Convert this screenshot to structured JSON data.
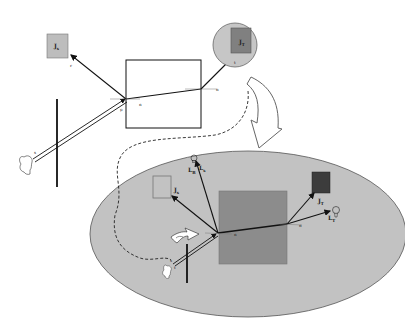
{
  "colors": {
    "background": "#ffffff",
    "ellipse_fill": "#c2c2c2",
    "circle_fill": "#c6c6c6",
    "light_square": "#bdbdbd",
    "mid_square": "#808080",
    "dark_square": "#3c3c3c",
    "big_square": "#8c8c8c",
    "stroke": "#111111"
  },
  "top_scene": {
    "reflect_source_label": "J",
    "reflect_source_sub": "s",
    "reflect_ray_label": "r",
    "transmit_source_label": "J",
    "transmit_source_sub": "T",
    "transmit_ray_label": "t",
    "entry_normal_label": "n",
    "exit_normal_label": "n",
    "point_label": "p",
    "eye_ray_label": "s"
  },
  "bottom_scene": {
    "left_square_label": "J",
    "left_square_sub": "s",
    "bulb_top_label": "L",
    "bulb_top_sub": "B",
    "bulb_top_label2": "L",
    "bulb_top_sub2": "s",
    "dark_square_label": "J",
    "dark_square_sub": "T",
    "bulb_right_label": "L",
    "bulb_right_sub": "T",
    "normal_label_1": "n",
    "normal_label_2": "n",
    "eye_ray_label": "s",
    "eye_ray_label2": "t"
  }
}
